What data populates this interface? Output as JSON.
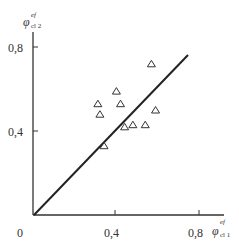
{
  "chart_data": {
    "type": "scatter",
    "title": "",
    "xlabel": "φ_cl1^ef",
    "ylabel": "φ_cl2^ef",
    "xlim": [
      0,
      0.9
    ],
    "ylim": [
      0,
      0.87
    ],
    "grid": false,
    "legend": null,
    "x_ticks": [
      "0",
      "0,4",
      "0,8"
    ],
    "y_ticks": [
      "0,4",
      "0,8"
    ],
    "series": [
      {
        "name": "data",
        "marker": "open-triangle",
        "points": [
          {
            "x": 0.4,
            "y": 0.59
          },
          {
            "x": 0.31,
            "y": 0.53
          },
          {
            "x": 0.42,
            "y": 0.53
          },
          {
            "x": 0.32,
            "y": 0.48
          },
          {
            "x": 0.59,
            "y": 0.5
          },
          {
            "x": 0.57,
            "y": 0.72
          },
          {
            "x": 0.44,
            "y": 0.42
          },
          {
            "x": 0.48,
            "y": 0.43
          },
          {
            "x": 0.54,
            "y": 0.43
          },
          {
            "x": 0.34,
            "y": 0.33
          }
        ]
      },
      {
        "name": "y = x",
        "type": "line",
        "points": [
          {
            "x": 0,
            "y": 0
          },
          {
            "x": 0.75,
            "y": 0.76
          }
        ]
      }
    ]
  },
  "labels": {
    "origin": "0",
    "x_tick_04": "0,4",
    "x_tick_08": "0,8",
    "y_tick_04": "0,4",
    "y_tick_08": "0,8",
    "x_axis_symbol": "φ",
    "x_axis_sup": "ef",
    "x_axis_sub": "cl 1",
    "y_axis_symbol": "φ",
    "y_axis_sup": "ef",
    "y_axis_sub": "cl 2"
  }
}
